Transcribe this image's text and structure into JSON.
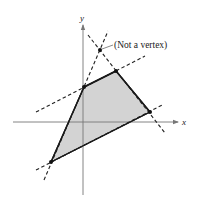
{
  "diagram": {
    "axes": {
      "x_label": "x",
      "y_label": "y",
      "color": "#777777"
    },
    "region": {
      "fill": "#d3d3d3",
      "stroke": "#1a1a1a",
      "vertices": [
        {
          "name": "A",
          "x": 51,
          "y": 162
        },
        {
          "name": "B",
          "x": 84,
          "y": 87
        },
        {
          "name": "C",
          "x": 116,
          "y": 71
        },
        {
          "name": "D",
          "x": 150,
          "y": 112
        }
      ]
    },
    "non_vertex_point": {
      "x": 100,
      "y": 50
    },
    "annotation": {
      "text": "(Not a vertex)"
    },
    "dashed_lines": [
      {
        "x1": 36,
        "y1": 112,
        "x2": 145,
        "y2": 56
      },
      {
        "x1": 88,
        "y1": 35,
        "x2": 165,
        "y2": 133
      },
      {
        "x1": 44,
        "y1": 180,
        "x2": 108,
        "y2": 31
      },
      {
        "x1": 36,
        "y1": 170,
        "x2": 164,
        "y2": 104
      }
    ]
  }
}
